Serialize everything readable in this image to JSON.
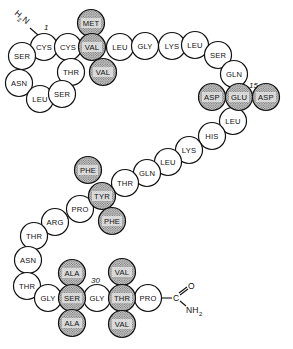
{
  "diagram": {
    "n_terminus": {
      "label_h": "H",
      "label_sub": "2",
      "label_n": "N",
      "position_number": "1"
    },
    "c_terminus": {
      "carbon": "C",
      "oxygen": "O",
      "amide_n": "NH",
      "amide_sub": "2"
    },
    "position_markers": [
      {
        "label": "1",
        "residue_index": 0
      },
      {
        "label": "15",
        "residue_index": 20
      },
      {
        "label": "30",
        "residue_index": 43
      }
    ],
    "legend": {
      "shaded": "highlighted residues (stippled)",
      "plain": "unhighlighted residues"
    },
    "residues": [
      {
        "name": "CYS",
        "shaded": false
      },
      {
        "name": "CYS",
        "shaded": false
      },
      {
        "name": "MET",
        "shaded": true
      },
      {
        "name": "VAL",
        "shaded": true
      },
      {
        "name": "VAL",
        "shaded": true
      },
      {
        "name": "THR",
        "shaded": false
      },
      {
        "name": "SER",
        "shaded": false
      },
      {
        "name": "ASN",
        "shaded": false
      },
      {
        "name": "LEU",
        "shaded": false
      },
      {
        "name": "SER",
        "shaded": false
      },
      {
        "name": "LEU",
        "shaded": false
      },
      {
        "name": "GLY",
        "shaded": false
      },
      {
        "name": "LYS",
        "shaded": false
      },
      {
        "name": "LEU",
        "shaded": false
      },
      {
        "name": "SER",
        "shaded": false
      },
      {
        "name": "GLN",
        "shaded": false
      },
      {
        "name": "ASP",
        "shaded": true
      },
      {
        "name": "GLU",
        "shaded": true
      },
      {
        "name": "ASP",
        "shaded": true
      },
      {
        "name": "LEU",
        "shaded": false
      },
      {
        "name": "HIS",
        "shaded": false
      },
      {
        "name": "LYS",
        "shaded": false
      },
      {
        "name": "LEU",
        "shaded": false
      },
      {
        "name": "GLN",
        "shaded": false
      },
      {
        "name": "THR",
        "shaded": false
      },
      {
        "name": "PHE",
        "shaded": true
      },
      {
        "name": "TYR",
        "shaded": true
      },
      {
        "name": "PHE",
        "shaded": true
      },
      {
        "name": "PRO",
        "shaded": false
      },
      {
        "name": "ARG",
        "shaded": false
      },
      {
        "name": "THR",
        "shaded": false
      },
      {
        "name": "ASN",
        "shaded": false
      },
      {
        "name": "THR",
        "shaded": false
      },
      {
        "name": "GLY",
        "shaded": false
      },
      {
        "name": "ALA",
        "shaded": true
      },
      {
        "name": "SER",
        "shaded": true
      },
      {
        "name": "ALA",
        "shaded": true
      },
      {
        "name": "GLY",
        "shaded": false
      },
      {
        "name": "VAL",
        "shaded": true
      },
      {
        "name": "THR",
        "shaded": true
      },
      {
        "name": "VAL",
        "shaded": true
      },
      {
        "name": "PRO",
        "shaded": false
      }
    ]
  }
}
